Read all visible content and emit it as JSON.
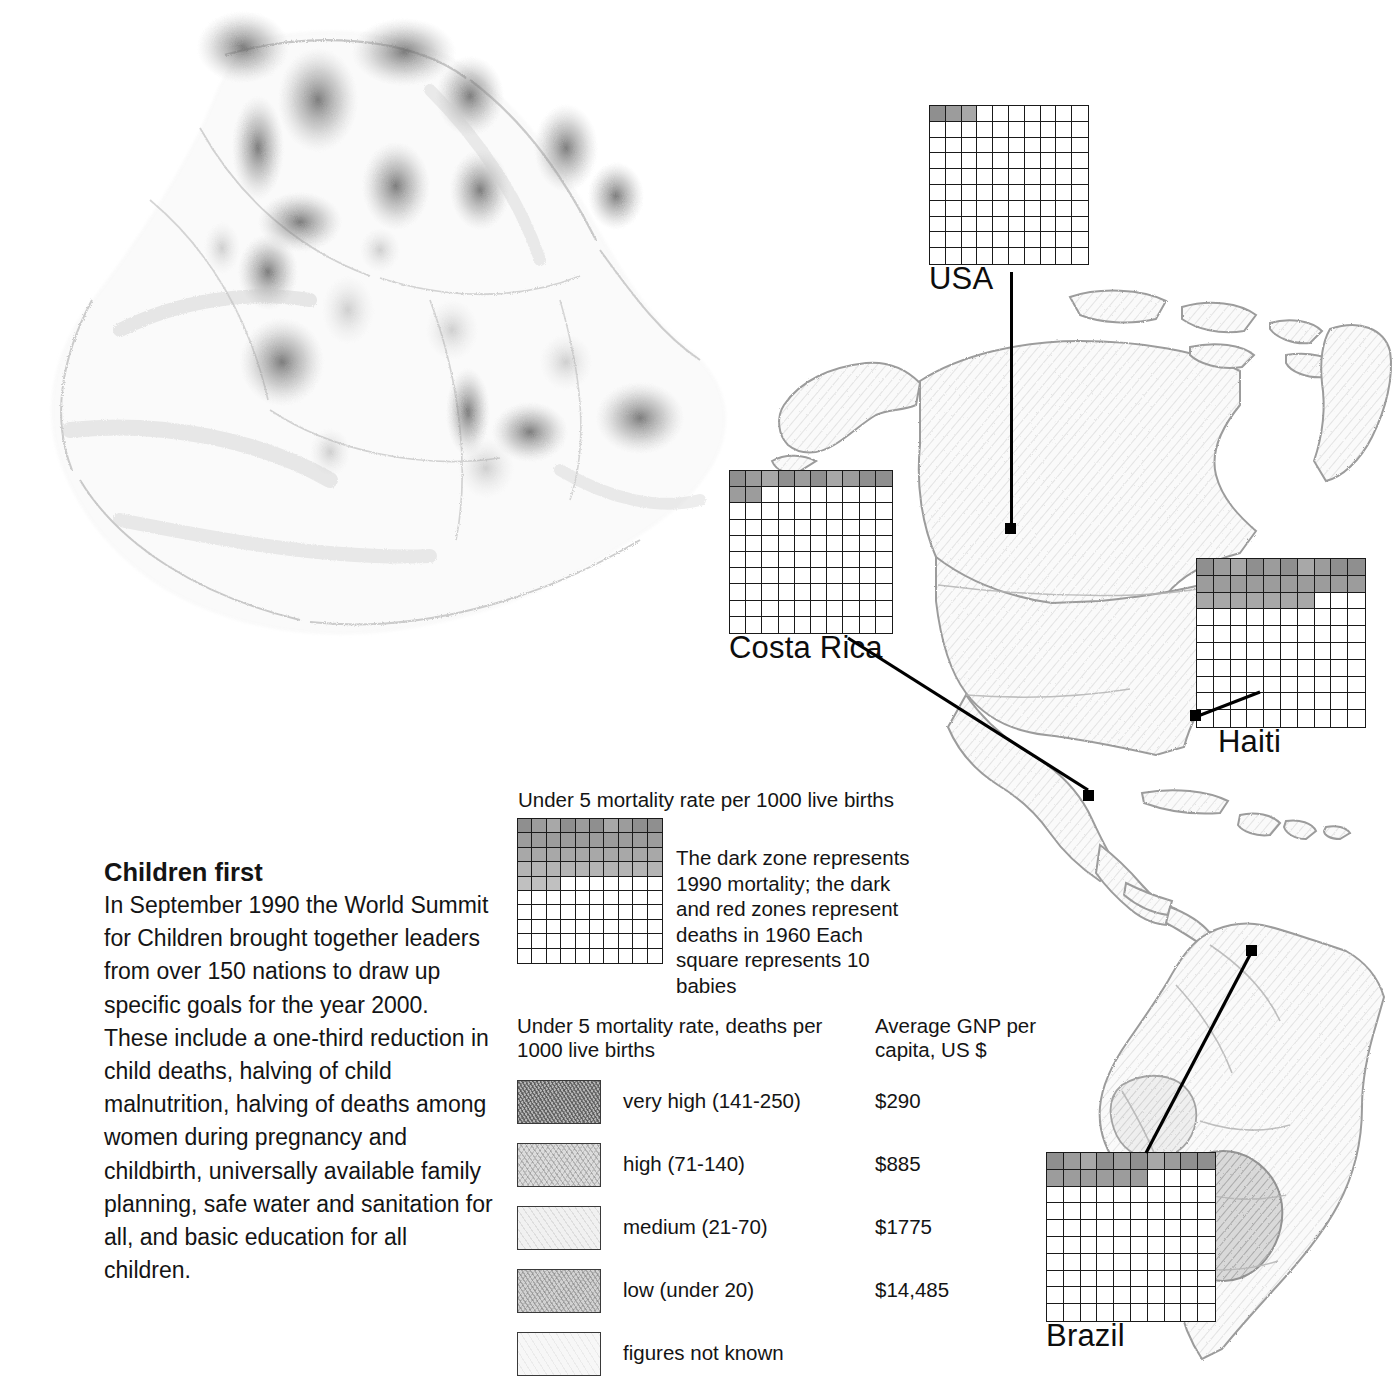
{
  "article": {
    "title": "Children first",
    "body": "In September 1990 the World Summit for Children brought together leaders from over 150 nations to draw up specific goals for the year 2000. These include a one-third reduction in child deaths, halving of child malnutrition, halving of deaths among women during pregnancy and childbirth, universally available family planning, safe water and sanitation for all, and basic education for all children."
  },
  "explanation": {
    "title": "Under 5 mortality rate per 1000 live births",
    "note": "The dark zone represents 1990 mortality; the dark and red zones represent deaths in 1960 Each square represents 10 babies"
  },
  "legend": {
    "header_left": "Under 5 mortality rate, deaths per 1000 live births",
    "header_right": "Average GNP per capita, US $",
    "rows": [
      {
        "label": "very high (141-250)",
        "gnp": "$290",
        "swatch": "very-high-swatch",
        "color": "#b4b4b4"
      },
      {
        "label": "high (71-140)",
        "gnp": "$885",
        "swatch": "high-swatch",
        "color": "#dcdcdc"
      },
      {
        "label": "medium (21-70)",
        "gnp": "$1775",
        "swatch": "medium-swatch",
        "color": "#f1f1f1"
      },
      {
        "label": "low (under 20)",
        "gnp": "$14,485",
        "swatch": "low-swatch",
        "color": "#d2d2d2"
      },
      {
        "label": "figures not known",
        "gnp": "",
        "swatch": "unknown-swatch",
        "color": "#f7f7f7"
      }
    ]
  },
  "countries": [
    {
      "name": "USA"
    },
    {
      "name": "Costa Rica"
    },
    {
      "name": "Haiti"
    },
    {
      "name": "Brazil"
    }
  ],
  "chart_data": {
    "type": "heatmap",
    "title": "Under 5 mortality rate per 1000 live births",
    "unit": "Each square represents 10 babies",
    "grid": {
      "rows": 10,
      "cols": 10
    },
    "colors": {
      "dark_1990": "#8f8f8f",
      "mid_1960": "#a8a8a8",
      "light": "#c6c6c6",
      "empty": "#ffffff"
    },
    "legend_entries": [
      {
        "category": "very high (141-250)",
        "range": [
          141,
          250
        ],
        "gnp_usd": 290
      },
      {
        "category": "high (71-140)",
        "range": [
          71,
          140
        ],
        "gnp_usd": 885
      },
      {
        "category": "medium (21-70)",
        "range": [
          21,
          70
        ],
        "gnp_usd": 1775
      },
      {
        "category": "low (under 20)",
        "range": [
          0,
          20
        ],
        "gnp_usd": 14485
      },
      {
        "category": "figures not known",
        "range": null,
        "gnp_usd": null
      }
    ],
    "series": [
      {
        "name": "Explanation key",
        "filled_squares": 43,
        "rate_per_1000": 430,
        "pattern": [
          10,
          10,
          10,
          10,
          3,
          0,
          0,
          0,
          0,
          0
        ]
      },
      {
        "name": "USA",
        "filled_squares": 3,
        "rate_per_1000": 30,
        "pattern": [
          3,
          0,
          0,
          0,
          0,
          0,
          0,
          0,
          0,
          0
        ]
      },
      {
        "name": "Costa Rica",
        "filled_squares": 12,
        "rate_per_1000": 120,
        "pattern": [
          10,
          2,
          0,
          0,
          0,
          0,
          0,
          0,
          0,
          0
        ]
      },
      {
        "name": "Haiti",
        "filled_squares": 27,
        "rate_per_1000": 270,
        "pattern": [
          10,
          10,
          7,
          0,
          0,
          0,
          0,
          0,
          0,
          0
        ]
      },
      {
        "name": "Brazil",
        "filled_squares": 16,
        "rate_per_1000": 160,
        "pattern": [
          10,
          6,
          0,
          0,
          0,
          0,
          0,
          0,
          0,
          0
        ]
      }
    ]
  }
}
